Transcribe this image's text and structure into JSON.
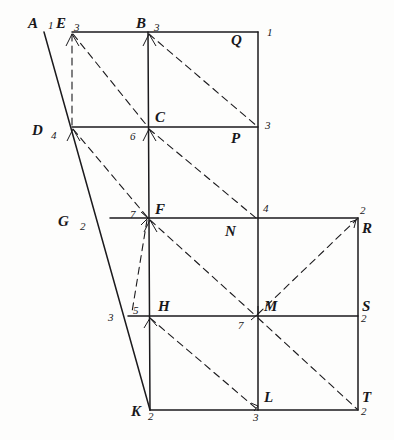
{
  "figure": {
    "stroke_color": "#1b1a1d",
    "background_color": "#fdfdfc"
  },
  "points": [
    {
      "id": "A",
      "label": "A",
      "x": 28,
      "y": 16
    },
    {
      "id": "E",
      "label": "E",
      "x": 56,
      "y": 16
    },
    {
      "id": "B",
      "label": "B",
      "x": 136,
      "y": 16
    },
    {
      "id": "Q",
      "label": "Q",
      "x": 231,
      "y": 33
    },
    {
      "id": "D",
      "label": "D",
      "x": 32,
      "y": 123
    },
    {
      "id": "C",
      "label": "C",
      "x": 155,
      "y": 110
    },
    {
      "id": "P",
      "label": "P",
      "x": 231,
      "y": 131
    },
    {
      "id": "G",
      "label": "G",
      "x": 58,
      "y": 214
    },
    {
      "id": "F",
      "label": "F",
      "x": 155,
      "y": 202
    },
    {
      "id": "N",
      "label": "N",
      "x": 225,
      "y": 224
    },
    {
      "id": "R",
      "label": "R",
      "x": 362,
      "y": 221
    },
    {
      "id": "H",
      "label": "H",
      "x": 158,
      "y": 299
    },
    {
      "id": "M",
      "label": "M",
      "x": 264,
      "y": 299
    },
    {
      "id": "S",
      "label": "S",
      "x": 362,
      "y": 299
    },
    {
      "id": "K",
      "label": "K",
      "x": 131,
      "y": 404
    },
    {
      "id": "L",
      "label": "L",
      "x": 264,
      "y": 390
    },
    {
      "id": "T",
      "label": "T",
      "x": 362,
      "y": 390
    }
  ],
  "numbers": [
    {
      "id": "n-A",
      "value": "1",
      "x": 48,
      "y": 20
    },
    {
      "id": "n-E",
      "value": "3",
      "x": 74,
      "y": 22
    },
    {
      "id": "n-B",
      "value": "3",
      "x": 154,
      "y": 22
    },
    {
      "id": "n-Q",
      "value": "1",
      "x": 267,
      "y": 27
    },
    {
      "id": "n-D",
      "value": "4",
      "x": 51,
      "y": 130
    },
    {
      "id": "n-C",
      "value": "6",
      "x": 130,
      "y": 131
    },
    {
      "id": "n-P",
      "value": "3",
      "x": 265,
      "y": 120
    },
    {
      "id": "n-G",
      "value": "2",
      "x": 80,
      "y": 221
    },
    {
      "id": "n-F",
      "value": "7",
      "x": 130,
      "y": 209
    },
    {
      "id": "n-N",
      "value": "4",
      "x": 263,
      "y": 203
    },
    {
      "id": "n-R",
      "value": "2",
      "x": 360,
      "y": 205
    },
    {
      "id": "n-H1",
      "value": "3",
      "x": 108,
      "y": 312
    },
    {
      "id": "n-H2",
      "value": "5",
      "x": 133,
      "y": 305
    },
    {
      "id": "n-M",
      "value": "7",
      "x": 238,
      "y": 320
    },
    {
      "id": "n-S",
      "value": "2",
      "x": 361,
      "y": 313
    },
    {
      "id": "n-K",
      "value": "2",
      "x": 148,
      "y": 411
    },
    {
      "id": "n-L",
      "value": "3",
      "x": 253,
      "y": 412
    },
    {
      "id": "n-T",
      "value": "2",
      "x": 361,
      "y": 406
    }
  ],
  "solid_segments": [
    {
      "id": "top-edge-E-Q",
      "x1": 72,
      "y1": 32,
      "x2": 258,
      "y2": 32
    },
    {
      "id": "side-A-K",
      "x1": 44,
      "y1": 32,
      "x2": 150,
      "y2": 410
    },
    {
      "id": "row-D-P",
      "x1": 72,
      "y1": 127,
      "x2": 258,
      "y2": 127
    },
    {
      "id": "row-G-R",
      "x1": 110,
      "y1": 218,
      "x2": 358,
      "y2": 218
    },
    {
      "id": "row-H-S",
      "x1": 128,
      "y1": 316,
      "x2": 358,
      "y2": 316
    },
    {
      "id": "row-K-T",
      "x1": 150,
      "y1": 410,
      "x2": 358,
      "y2": 410
    },
    {
      "id": "col-B-K",
      "x1": 148,
      "y1": 32,
      "x2": 150,
      "y2": 410
    },
    {
      "id": "col-Q-L",
      "x1": 258,
      "y1": 32,
      "x2": 258,
      "y2": 410
    },
    {
      "id": "col-R-T",
      "x1": 358,
      "y1": 218,
      "x2": 358,
      "y2": 410
    }
  ],
  "dashed_segments": [
    {
      "id": "dash-E-D",
      "x1": 72,
      "y1": 34,
      "x2": 72,
      "y2": 127
    },
    {
      "id": "dash-E-C",
      "x1": 73,
      "y1": 34,
      "x2": 148,
      "y2": 127
    },
    {
      "id": "dash-B-P",
      "x1": 149,
      "y1": 34,
      "x2": 258,
      "y2": 127
    },
    {
      "id": "dash-D-F",
      "x1": 73,
      "y1": 129,
      "x2": 148,
      "y2": 218
    },
    {
      "id": "dash-C-N",
      "x1": 149,
      "y1": 129,
      "x2": 256,
      "y2": 218
    },
    {
      "id": "dash-F-M",
      "x1": 150,
      "y1": 220,
      "x2": 256,
      "y2": 316
    },
    {
      "id": "dash-M-R",
      "x1": 258,
      "y1": 314,
      "x2": 357,
      "y2": 219
    },
    {
      "id": "dash-F-K",
      "x1": 147,
      "y1": 220,
      "x2": 132,
      "y2": 312
    },
    {
      "id": "dash-H-L",
      "x1": 150,
      "y1": 318,
      "x2": 258,
      "y2": 410
    },
    {
      "id": "dash-M-T",
      "x1": 258,
      "y1": 318,
      "x2": 357,
      "y2": 409
    }
  ]
}
